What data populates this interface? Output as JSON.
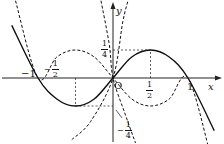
{
  "chart_data": {
    "type": "line",
    "title": "",
    "xlabel": "x",
    "ylabel": "y",
    "origin_label": "O",
    "xlim": [
      -1.45,
      1.45
    ],
    "ylim": [
      -0.58,
      0.68
    ],
    "grid": false,
    "x_ticks": [
      {
        "value": -1,
        "label": "-1"
      },
      {
        "value": -0.5,
        "num": "1",
        "den": "2",
        "sign": "-"
      },
      {
        "value": 0.5,
        "num": "1",
        "den": "2",
        "sign": ""
      },
      {
        "value": 1,
        "label": "1"
      }
    ],
    "y_ticks": [
      {
        "value": 0.25,
        "num": "1",
        "den": "4",
        "sign": ""
      },
      {
        "value": -0.25,
        "num": "1",
        "den": "4",
        "sign": "-"
      }
    ],
    "series": [
      {
        "name": "solid curve",
        "style": "solid",
        "formula": "y = x - x|x|",
        "points": [
          [
            -1.35,
            0.47
          ],
          [
            -1,
            0
          ],
          [
            -0.75,
            -0.1875
          ],
          [
            -0.5,
            -0.25
          ],
          [
            -0.25,
            -0.1875
          ],
          [
            0,
            0
          ],
          [
            0.25,
            0.1875
          ],
          [
            0.5,
            0.25
          ],
          [
            0.75,
            0.1875
          ],
          [
            1,
            0
          ],
          [
            1.35,
            -0.47
          ]
        ]
      },
      {
        "name": "dashed curve 1",
        "style": "dashed",
        "points": [
          [
            -1.3,
            0.69
          ],
          [
            -1,
            0
          ],
          [
            -0.75,
            0.1875
          ],
          [
            -0.5,
            0.25
          ],
          [
            -0.25,
            0.1875
          ],
          [
            0,
            0
          ],
          [
            0.25,
            -0.1875
          ],
          [
            0.5,
            -0.25
          ],
          [
            0.75,
            -0.1875
          ],
          [
            1,
            0
          ],
          [
            1.3,
            -0.69
          ]
        ]
      },
      {
        "name": "dashed curve 2",
        "style": "dashed",
        "points": [
          [
            -0.55,
            -0.55
          ],
          [
            -0.3,
            -0.39
          ],
          [
            0,
            0
          ],
          [
            0.13,
            0.5
          ],
          [
            0.2,
            0.69
          ]
        ]
      },
      {
        "name": "dashed curve 3",
        "style": "dashed",
        "points": [
          [
            -0.16,
            0.69
          ],
          [
            -0.05,
            0.3
          ],
          [
            0,
            0
          ],
          [
            0.15,
            -0.3
          ],
          [
            0.3,
            -0.58
          ]
        ]
      }
    ],
    "guides": [
      {
        "from": [
          0.5,
          0
        ],
        "to": [
          0.5,
          0.25
        ]
      },
      {
        "from": [
          0,
          0.25
        ],
        "to": [
          0.5,
          0.25
        ]
      },
      {
        "from": [
          -0.5,
          0
        ],
        "to": [
          -0.5,
          -0.25
        ]
      },
      {
        "from": [
          -0.5,
          -0.25
        ],
        "to": [
          0,
          -0.25
        ]
      }
    ]
  },
  "labels": {
    "x_axis": "x",
    "y_axis": "y",
    "origin": "O",
    "neg_one": "−1",
    "one": "1",
    "half_num": "1",
    "half_den": "2",
    "quarter_num": "1",
    "quarter_den": "4",
    "minus": "−"
  }
}
